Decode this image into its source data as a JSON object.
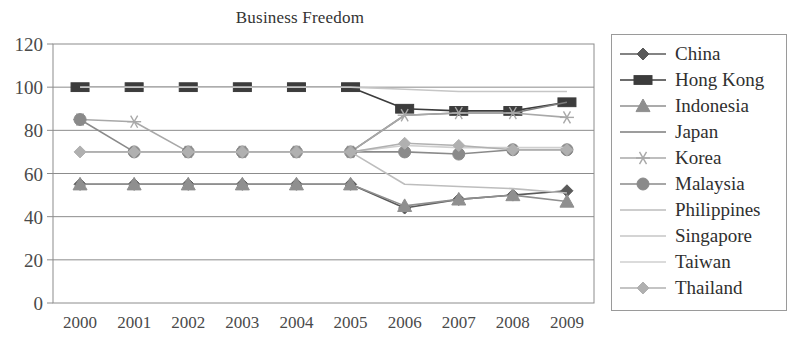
{
  "chart_data": {
    "type": "line",
    "title": "Business Freedom",
    "xlabel": "",
    "ylabel": "",
    "x": [
      "2000",
      "2001",
      "2002",
      "2003",
      "2004",
      "2005",
      "2006",
      "2007",
      "2008",
      "2009"
    ],
    "ylim": [
      0,
      120
    ],
    "ytick_labels": [
      "0",
      "20",
      "40",
      "60",
      "80",
      "100",
      "120"
    ],
    "ytick_values": [
      0,
      20,
      40,
      60,
      80,
      100,
      120
    ],
    "grid": "horizontal",
    "legend_position": "right",
    "series": [
      {
        "name": "China",
        "marker": "diamond",
        "color": "#5a5a5a",
        "values": [
          55,
          55,
          55,
          55,
          55,
          55,
          44,
          48,
          50,
          52
        ]
      },
      {
        "name": "Hong Kong",
        "marker": "square",
        "color": "#3c3c3c",
        "values": [
          100,
          100,
          100,
          100,
          100,
          100,
          90,
          89,
          89,
          93
        ]
      },
      {
        "name": "Indonesia",
        "marker": "triangle",
        "color": "#8f8f8f",
        "values": [
          55,
          55,
          55,
          55,
          55,
          55,
          45,
          48,
          50,
          47
        ]
      },
      {
        "name": "Japan",
        "marker": "none",
        "color": "#7d7d7d",
        "values": [
          70,
          70,
          70,
          70,
          70,
          70,
          87,
          88,
          88,
          93
        ]
      },
      {
        "name": "Korea",
        "marker": "star",
        "color": "#a8a8a8",
        "values": [
          85,
          84,
          70,
          70,
          70,
          70,
          87,
          88,
          88,
          86
        ]
      },
      {
        "name": "Malaysia",
        "marker": "circle",
        "color": "#8a8a8a",
        "values": [
          85,
          70,
          70,
          70,
          70,
          70,
          70,
          69,
          71,
          71
        ]
      },
      {
        "name": "Philippines",
        "marker": "none",
        "color": "#bdbdbd",
        "values": [
          70,
          70,
          70,
          70,
          70,
          70,
          55,
          54,
          53,
          51
        ]
      },
      {
        "name": "Singapore",
        "marker": "none",
        "color": "#c6c6c6",
        "values": [
          100,
          100,
          100,
          100,
          100,
          100,
          99,
          98,
          98,
          98
        ]
      },
      {
        "name": "Taiwan",
        "marker": "none",
        "color": "#cfcfcf",
        "values": [
          70,
          70,
          70,
          70,
          70,
          70,
          73,
          72,
          72,
          72
        ]
      },
      {
        "name": "Thailand",
        "marker": "diamond-light",
        "color": "#b0b0b0",
        "values": [
          70,
          70,
          70,
          70,
          70,
          70,
          74,
          73,
          71,
          71
        ]
      }
    ]
  },
  "legend": {
    "items": [
      {
        "label": "China"
      },
      {
        "label": "Hong Kong"
      },
      {
        "label": "Indonesia"
      },
      {
        "label": "Japan"
      },
      {
        "label": "Korea"
      },
      {
        "label": "Malaysia"
      },
      {
        "label": "Philippines"
      },
      {
        "label": "Singapore"
      },
      {
        "label": "Taiwan"
      },
      {
        "label": "Thailand"
      }
    ]
  }
}
